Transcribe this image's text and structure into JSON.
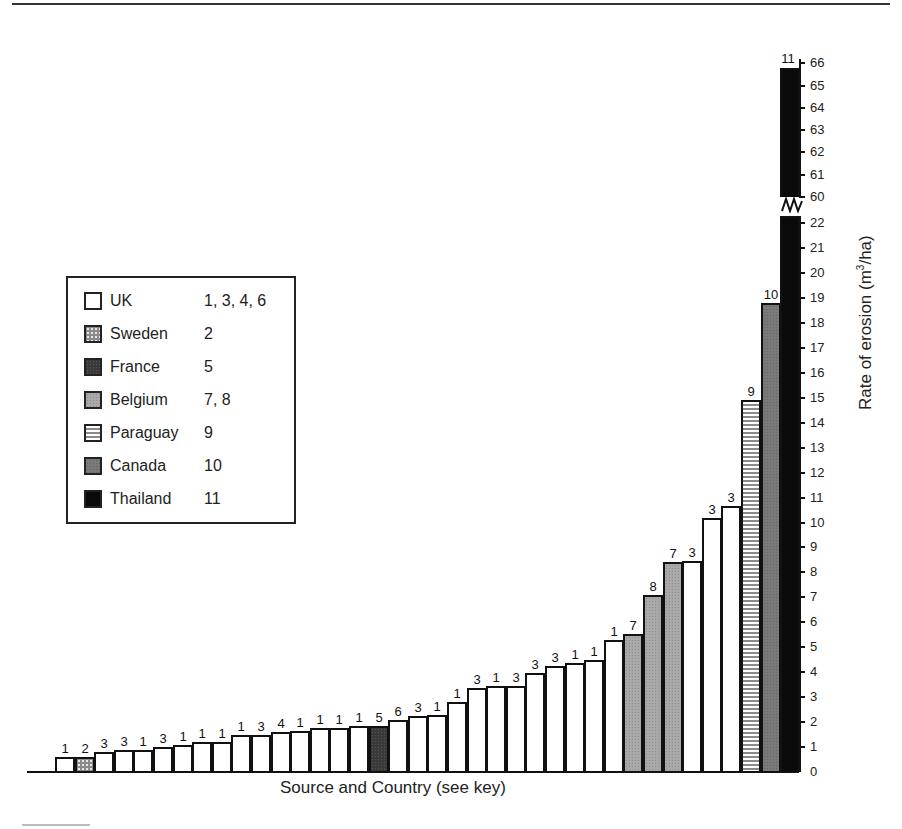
{
  "chart_data": {
    "type": "bar",
    "title": "",
    "xlabel": "Source and Country (see key)",
    "ylabel": "Rate of erosion (m3/ha)",
    "ylabel_parts": {
      "pre": "Rate of erosion (m",
      "sup": "3",
      "post": "/ha)"
    },
    "ylim": [
      0,
      66
    ],
    "y_axis_break": [
      22,
      60
    ],
    "y_ticks_lower": [
      0,
      1,
      2,
      3,
      4,
      5,
      6,
      7,
      8,
      9,
      10,
      11,
      12,
      13,
      14,
      15,
      16,
      17,
      18,
      19,
      20,
      21,
      22
    ],
    "y_ticks_upper": [
      60,
      61,
      62,
      63,
      64,
      65,
      66
    ],
    "grid": false,
    "legend_position": "left-middle",
    "legend": [
      {
        "country": "UK",
        "sources": "1, 3, 4, 6",
        "fill": "white"
      },
      {
        "country": "Sweden",
        "sources": "2",
        "fill": "dotted-grey"
      },
      {
        "country": "France",
        "sources": "5",
        "fill": "dark-grey"
      },
      {
        "country": "Belgium",
        "sources": "7, 8",
        "fill": "light-grey"
      },
      {
        "country": "Paraguay",
        "sources": "9",
        "fill": "horizontal-stripes"
      },
      {
        "country": "Canada",
        "sources": "10",
        "fill": "mid-grey"
      },
      {
        "country": "Thailand",
        "sources": "11",
        "fill": "black"
      }
    ],
    "bars": [
      {
        "source": "1",
        "country": "UK",
        "value": 0.6
      },
      {
        "source": "2",
        "country": "Sweden",
        "value": 0.6
      },
      {
        "source": "3",
        "country": "UK",
        "value": 0.8
      },
      {
        "source": "3",
        "country": "UK",
        "value": 0.9
      },
      {
        "source": "1",
        "country": "UK",
        "value": 0.9
      },
      {
        "source": "3",
        "country": "UK",
        "value": 1.0
      },
      {
        "source": "1",
        "country": "UK",
        "value": 1.1
      },
      {
        "source": "1",
        "country": "UK",
        "value": 1.2
      },
      {
        "source": "1",
        "country": "UK",
        "value": 1.2
      },
      {
        "source": "1",
        "country": "UK",
        "value": 1.5
      },
      {
        "source": "3",
        "country": "UK",
        "value": 1.5
      },
      {
        "source": "4",
        "country": "UK",
        "value": 1.6
      },
      {
        "source": "1",
        "country": "UK",
        "value": 1.65
      },
      {
        "source": "1",
        "country": "UK",
        "value": 1.75
      },
      {
        "source": "1",
        "country": "UK",
        "value": 1.75
      },
      {
        "source": "1",
        "country": "UK",
        "value": 1.85
      },
      {
        "source": "5",
        "country": "France",
        "value": 1.85
      },
      {
        "source": "6",
        "country": "UK",
        "value": 2.1
      },
      {
        "source": "3",
        "country": "UK",
        "value": 2.25
      },
      {
        "source": "1",
        "country": "UK",
        "value": 2.3
      },
      {
        "source": "1",
        "country": "UK",
        "value": 2.8
      },
      {
        "source": "3",
        "country": "UK",
        "value": 3.35
      },
      {
        "source": "1",
        "country": "UK",
        "value": 3.45
      },
      {
        "source": "3",
        "country": "UK",
        "value": 3.45
      },
      {
        "source": "3",
        "country": "UK",
        "value": 3.95
      },
      {
        "source": "3",
        "country": "UK",
        "value": 4.25
      },
      {
        "source": "1",
        "country": "UK",
        "value": 4.35
      },
      {
        "source": "1",
        "country": "UK",
        "value": 4.5
      },
      {
        "source": "1",
        "country": "UK",
        "value": 5.3
      },
      {
        "source": "7",
        "country": "Belgium",
        "value": 5.55
      },
      {
        "source": "8",
        "country": "Belgium",
        "value": 7.1
      },
      {
        "source": "7",
        "country": "Belgium",
        "value": 8.4
      },
      {
        "source": "3",
        "country": "UK",
        "value": 8.45
      },
      {
        "source": "3",
        "country": "UK",
        "value": 10.2
      },
      {
        "source": "3",
        "country": "UK",
        "value": 10.65
      },
      {
        "source": "9",
        "country": "Paraguay",
        "value": 14.9
      },
      {
        "source": "10",
        "country": "Canada",
        "value": 18.8
      },
      {
        "source": "11",
        "country": "Thailand",
        "value": 65.8
      }
    ]
  },
  "fill_colors": {
    "UK": "#ffffff",
    "Sweden": "#8a8a8a",
    "France": "#3a3a3a",
    "Belgium": "#a9a9a9",
    "Paraguay": "#8a8a8a",
    "Canada": "#7a7a7a",
    "Thailand": "#0a0a0a"
  }
}
